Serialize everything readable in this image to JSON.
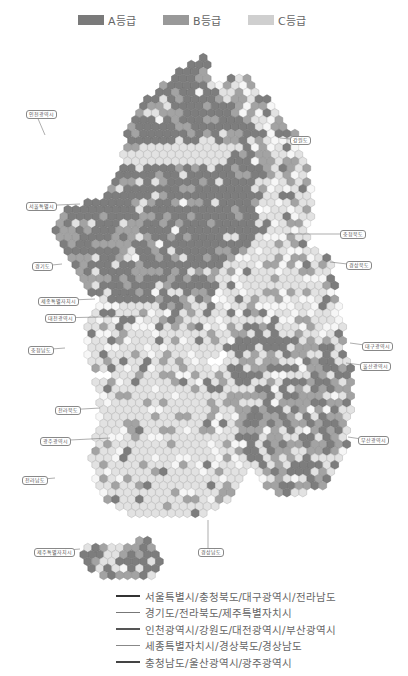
{
  "legend_top": {
    "items": [
      {
        "label": "A등급",
        "color": "#7a7a7a",
        "x": 78
      },
      {
        "label": "B등급",
        "color": "#999999",
        "x": 163
      },
      {
        "label": "C등급",
        "color": "#cfcfcf",
        "x": 248
      }
    ]
  },
  "grades": {
    "A": {
      "fill": "#7d7d7d",
      "stroke": "#666666"
    },
    "B": {
      "fill": "#a3a3a3",
      "stroke": "#8a8a8a"
    },
    "C": {
      "fill": "#e2e2e2",
      "stroke": "#b5b5b5"
    },
    "empty": {
      "fill": "#f6f6f6",
      "stroke": "#c9c9c9"
    }
  },
  "region_labels": [
    {
      "label": "인천광역시",
      "x": 26,
      "y": 110,
      "tx": 45,
      "ty": 135
    },
    {
      "label": "강원도",
      "x": 290,
      "y": 136,
      "tx": 280,
      "ty": 138
    },
    {
      "label": "서울특별시",
      "x": 26,
      "y": 202,
      "tx": 80,
      "ty": 204
    },
    {
      "label": "충청북도",
      "x": 340,
      "y": 230,
      "tx": 285,
      "ty": 234
    },
    {
      "label": "경기도",
      "x": 32,
      "y": 262,
      "tx": 62,
      "ty": 264
    },
    {
      "label": "경상북도",
      "x": 346,
      "y": 261,
      "tx": 330,
      "ty": 262
    },
    {
      "label": "세종특별자치시",
      "x": 38,
      "y": 297,
      "tx": 95,
      "ty": 299
    },
    {
      "label": "대전광역시",
      "x": 45,
      "y": 314,
      "tx": 145,
      "ty": 316
    },
    {
      "label": "충청남도",
      "x": 28,
      "y": 346,
      "tx": 65,
      "ty": 348
    },
    {
      "label": "대구광역시",
      "x": 362,
      "y": 342,
      "tx": 350,
      "ty": 343
    },
    {
      "label": "울산광역시",
      "x": 360,
      "y": 362,
      "tx": 346,
      "ty": 363
    },
    {
      "label": "전라북도",
      "x": 55,
      "y": 406,
      "tx": 100,
      "ty": 408
    },
    {
      "label": "부산광역시",
      "x": 358,
      "y": 436,
      "tx": 348,
      "ty": 437
    },
    {
      "label": "광주광역시",
      "x": 40,
      "y": 437,
      "tx": 110,
      "ty": 438
    },
    {
      "label": "전라남도",
      "x": 22,
      "y": 476,
      "tx": 55,
      "ty": 478
    },
    {
      "label": "제주특별자치시",
      "x": 34,
      "y": 548,
      "tx": 80,
      "ty": 549
    },
    {
      "label": "경상남도",
      "x": 198,
      "y": 548,
      "tx": 208,
      "ty": 520
    }
  ],
  "legend_bottom": {
    "items": [
      {
        "label": "서울특별시/충청북도/대구광역시/전라남도",
        "color": "#333333",
        "width": 2.2
      },
      {
        "label": "경기도/전라북도/제주특별자치시",
        "color": "#777777",
        "width": 1.4
      },
      {
        "label": "인천광역시/강원도/대전광역시/부산광역시",
        "color": "#555555",
        "width": 2.2
      },
      {
        "label": "세종특별자치시/경상북도/경상남도",
        "color": "#888888",
        "width": 1.2
      },
      {
        "label": "충청남도/울산광역시/광주광역시",
        "color": "#444444",
        "width": 2.2
      }
    ]
  },
  "map": {
    "hex_r": 4.6,
    "zones": [
      {
        "name": "north-west-capital",
        "poly": [
          [
            48,
            230
          ],
          [
            60,
            212
          ],
          [
            100,
            198
          ],
          [
            120,
            170
          ],
          [
            130,
            120
          ],
          [
            140,
            100
          ],
          [
            170,
            80
          ],
          [
            190,
            60
          ],
          [
            205,
            55
          ],
          [
            215,
            90
          ],
          [
            240,
            110
          ],
          [
            265,
            140
          ],
          [
            270,
            170
          ],
          [
            260,
            200
          ],
          [
            255,
            240
          ],
          [
            225,
            270
          ],
          [
            210,
            300
          ],
          [
            170,
            310
          ],
          [
            135,
            300
          ],
          [
            100,
            300
          ],
          [
            80,
            285
          ],
          [
            70,
            260
          ],
          [
            60,
            245
          ]
        ],
        "mix": [
          0.62,
          0.28,
          0.08
        ]
      },
      {
        "name": "gangwon-east",
        "poly": [
          [
            210,
            90
          ],
          [
            240,
            70
          ],
          [
            270,
            100
          ],
          [
            300,
            140
          ],
          [
            315,
            190
          ],
          [
            310,
            230
          ],
          [
            300,
            260
          ],
          [
            270,
            250
          ],
          [
            260,
            200
          ],
          [
            270,
            150
          ]
        ],
        "mix": [
          0.1,
          0.18,
          0.45
        ]
      },
      {
        "name": "chungbuk-gyeongbuk",
        "poly": [
          [
            255,
            210
          ],
          [
            300,
            240
          ],
          [
            330,
            260
          ],
          [
            340,
            300
          ],
          [
            345,
            330
          ],
          [
            320,
            345
          ],
          [
            280,
            320
          ],
          [
            240,
            300
          ],
          [
            215,
            300
          ],
          [
            225,
            270
          ]
        ],
        "mix": [
          0.08,
          0.15,
          0.5
        ]
      },
      {
        "name": "chungnam-sejong",
        "poly": [
          [
            85,
            320
          ],
          [
            100,
            300
          ],
          [
            140,
            300
          ],
          [
            200,
            305
          ],
          [
            240,
            305
          ],
          [
            240,
            340
          ],
          [
            210,
            360
          ],
          [
            170,
            370
          ],
          [
            120,
            380
          ],
          [
            95,
            370
          ],
          [
            85,
            350
          ]
        ],
        "mix": [
          0.08,
          0.12,
          0.6
        ]
      },
      {
        "name": "gyeongnam-busan-daegu",
        "poly": [
          [
            240,
            300
          ],
          [
            280,
            320
          ],
          [
            340,
            330
          ],
          [
            355,
            370
          ],
          [
            350,
            420
          ],
          [
            345,
            460
          ],
          [
            320,
            490
          ],
          [
            280,
            500
          ],
          [
            250,
            470
          ],
          [
            235,
            420
          ],
          [
            230,
            360
          ]
        ],
        "mix": [
          0.36,
          0.32,
          0.26
        ]
      },
      {
        "name": "jeolla",
        "poly": [
          [
            95,
            380
          ],
          [
            170,
            370
          ],
          [
            230,
            360
          ],
          [
            235,
            420
          ],
          [
            250,
            470
          ],
          [
            230,
            500
          ],
          [
            190,
            520
          ],
          [
            140,
            520
          ],
          [
            100,
            500
          ],
          [
            90,
            460
          ],
          [
            100,
            420
          ]
        ],
        "mix": [
          0.04,
          0.12,
          0.7
        ]
      },
      {
        "name": "jeju-strip",
        "poly": [
          [
            80,
            545
          ],
          [
            150,
            540
          ],
          [
            165,
            560
          ],
          [
            150,
            580
          ],
          [
            100,
            578
          ],
          [
            80,
            565
          ]
        ],
        "mix": [
          0.35,
          0.2,
          0.4
        ]
      }
    ],
    "band": {
      "poly": [
        [
          120,
          152
        ],
        [
          160,
          144
        ],
        [
          210,
          140
        ],
        [
          235,
          148
        ],
        [
          232,
          160
        ],
        [
          200,
          165
        ],
        [
          160,
          168
        ],
        [
          125,
          168
        ]
      ],
      "grade": "C"
    }
  }
}
